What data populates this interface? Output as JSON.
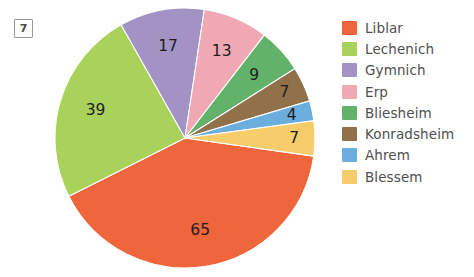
{
  "figure": {
    "marker_label": "7"
  },
  "legend": {
    "position": "right",
    "items": [
      {
        "label": "Liblar",
        "color": "#f0663c"
      },
      {
        "label": "Lechenich",
        "color": "#a8d25a"
      },
      {
        "label": "Gymnich",
        "color": "#a393c4"
      },
      {
        "label": "Erp",
        "color": "#f0a8b4"
      },
      {
        "label": "Bliesheim",
        "color": "#62b369"
      },
      {
        "label": "Konradsheim",
        "color": "#91714a"
      },
      {
        "label": "Ahrem",
        "color": "#6aaede"
      },
      {
        "label": "Blessem",
        "color": "#f7cd6b"
      }
    ]
  },
  "chart_data": {
    "type": "pie",
    "title": "",
    "total": 161,
    "labels_shown": true,
    "categories": [
      "Liblar",
      "Lechenich",
      "Gymnich",
      "Erp",
      "Bliesheim",
      "Konradsheim",
      "Ahrem",
      "Blessem"
    ],
    "values": [
      65,
      39,
      17,
      13,
      9,
      7,
      4,
      7
    ],
    "colors": [
      "#f0663c",
      "#a8d25a",
      "#a393c4",
      "#f0a8b4",
      "#62b369",
      "#91714a",
      "#6aaede",
      "#f7cd6b"
    ],
    "slices": [
      {
        "label": "Liblar",
        "value": 65,
        "color": "#f0663c",
        "value_text": "65"
      },
      {
        "label": "Lechenich",
        "value": 39,
        "color": "#a8d25a",
        "value_text": "39"
      },
      {
        "label": "Gymnich",
        "value": 17,
        "color": "#a393c4",
        "value_text": "17"
      },
      {
        "label": "Erp",
        "value": 13,
        "color": "#f0a8b4",
        "value_text": "13"
      },
      {
        "label": "Bliesheim",
        "value": 9,
        "color": "#62b369",
        "value_text": "9"
      },
      {
        "label": "Konradsheim",
        "value": 7,
        "color": "#91714a",
        "value_text": "7"
      },
      {
        "label": "Ahrem",
        "value": 4,
        "color": "#6aaede",
        "value_text": "4"
      },
      {
        "label": "Blessem",
        "value": 7,
        "color": "#f7cd6b",
        "value_text": "7"
      }
    ]
  }
}
